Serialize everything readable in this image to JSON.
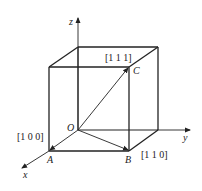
{
  "diagram": {
    "type": "cubic-crystal-directions",
    "axes": {
      "x": "x",
      "y": "y",
      "z": "z"
    },
    "points": {
      "origin": "O",
      "A": "A",
      "B": "B",
      "C": "C"
    },
    "directions": {
      "OA": "[1 0 0]",
      "OB": "[1 1 0]",
      "OC": "[1 1 1]"
    },
    "colors": {
      "line": "#222222",
      "background": "#ffffff"
    }
  }
}
